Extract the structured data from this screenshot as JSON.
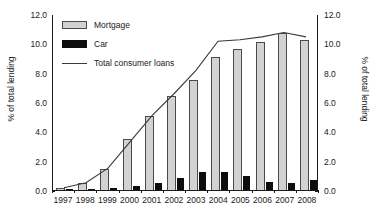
{
  "chart_data": {
    "type": "bar",
    "title": "",
    "xlabel": "",
    "ylabel": "% of total lending",
    "ylabel_right": "% of total lending",
    "ylim": [
      0.0,
      12.0
    ],
    "ylim_right": [
      0.0,
      12.0
    ],
    "ytick_labels": [
      "0.0",
      "2.0",
      "4.0",
      "6.0",
      "8.0",
      "10.0",
      "12.0"
    ],
    "ytick_values": [
      0.0,
      2.0,
      4.0,
      6.0,
      8.0,
      10.0,
      12.0
    ],
    "ytick_labels_right": [
      "0.0",
      "2.0",
      "4.0",
      "6.0",
      "8.0",
      "10.0",
      "12.0"
    ],
    "grid": false,
    "legend_position": "top-left",
    "categories": [
      "1997",
      "1998",
      "1999",
      "2000",
      "2001",
      "2002",
      "2003",
      "2004",
      "2005",
      "2006",
      "2007",
      "2008"
    ],
    "series": [
      {
        "name": "Mortgage",
        "kind": "bar",
        "color": "#d2d2d2",
        "edge_color": "#4a4a4a",
        "axis": "left",
        "values": [
          0.15,
          0.45,
          1.45,
          3.45,
          5.05,
          6.4,
          7.5,
          9.1,
          9.6,
          10.1,
          10.7,
          10.2
        ]
      },
      {
        "name": "Car",
        "kind": "bar",
        "color": "#0d0d0d",
        "edge_color": "#0d0d0d",
        "axis": "left",
        "values": [
          0.05,
          0.08,
          0.12,
          0.28,
          0.45,
          0.85,
          1.25,
          1.2,
          0.95,
          0.55,
          0.5,
          0.65
        ]
      },
      {
        "name": "Total consumer loans",
        "kind": "line",
        "color": "#3a3a3a",
        "axis": "right",
        "values": [
          0.15,
          0.5,
          1.5,
          3.3,
          5.1,
          6.6,
          8.2,
          10.2,
          10.3,
          10.5,
          10.8,
          10.5
        ]
      }
    ]
  },
  "legend": {
    "items": [
      {
        "label": "Mortgage",
        "swatch": "bar-gray-swatch"
      },
      {
        "label": "Car",
        "swatch": "bar-black-swatch"
      },
      {
        "label": "Total consumer loans",
        "swatch": "line-swatch"
      }
    ]
  },
  "colors": {
    "mortgage": "#d2d2d2",
    "mortgage_edge": "#4a4a4a",
    "car": "#0d0d0d",
    "line": "#3a3a3a",
    "axis": "#1a1a1a",
    "background": "#ffffff"
  }
}
